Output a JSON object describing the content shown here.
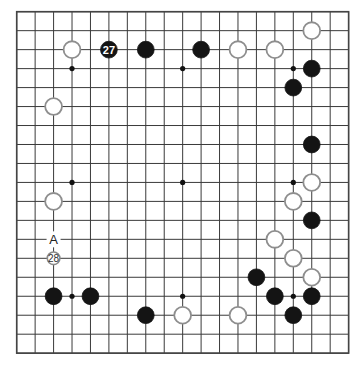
{
  "board": {
    "size": 19,
    "origin_x": 16.7,
    "origin_y": 11.7,
    "spacing_x": 18.44,
    "spacing_y": 18.97,
    "stone_radius": 8.4,
    "colors": {
      "grid": "#3a3a3a",
      "black_stone": "#141414",
      "white_stone_fill": "#ffffff",
      "white_stone_border": "#8e8e8e"
    }
  },
  "star_points": [
    [
      3,
      3
    ],
    [
      9,
      3
    ],
    [
      15,
      3
    ],
    [
      3,
      9
    ],
    [
      9,
      9
    ],
    [
      15,
      9
    ],
    [
      3,
      15
    ],
    [
      9,
      15
    ],
    [
      15,
      15
    ]
  ],
  "stones": [
    {
      "color": "white",
      "col": 16,
      "row": 1
    },
    {
      "color": "white",
      "col": 3,
      "row": 2
    },
    {
      "color": "black",
      "col": 5,
      "row": 2,
      "number": "27"
    },
    {
      "color": "black",
      "col": 7,
      "row": 2
    },
    {
      "color": "black",
      "col": 10,
      "row": 2
    },
    {
      "color": "white",
      "col": 12,
      "row": 2
    },
    {
      "color": "white",
      "col": 14,
      "row": 2
    },
    {
      "color": "black",
      "col": 16,
      "row": 3
    },
    {
      "color": "black",
      "col": 15,
      "row": 4
    },
    {
      "color": "white",
      "col": 2,
      "row": 5
    },
    {
      "color": "black",
      "col": 16,
      "row": 7
    },
    {
      "color": "white",
      "col": 16,
      "row": 9
    },
    {
      "color": "white",
      "col": 2,
      "row": 10
    },
    {
      "color": "white",
      "col": 15,
      "row": 10
    },
    {
      "color": "black",
      "col": 16,
      "row": 11
    },
    {
      "color": "white",
      "col": 14,
      "row": 12
    },
    {
      "color": "white",
      "col": 2,
      "row": 13,
      "number": "28",
      "small": true
    },
    {
      "color": "white",
      "col": 15,
      "row": 13
    },
    {
      "color": "black",
      "col": 13,
      "row": 14
    },
    {
      "color": "white",
      "col": 16,
      "row": 14
    },
    {
      "color": "black",
      "col": 2,
      "row": 15
    },
    {
      "color": "black",
      "col": 4,
      "row": 15
    },
    {
      "color": "black",
      "col": 14,
      "row": 15
    },
    {
      "color": "black",
      "col": 16,
      "row": 15
    },
    {
      "color": "black",
      "col": 7,
      "row": 16
    },
    {
      "color": "white",
      "col": 9,
      "row": 16
    },
    {
      "color": "white",
      "col": 12,
      "row": 16
    },
    {
      "color": "black",
      "col": 15,
      "row": 16
    }
  ],
  "labels": [
    {
      "text": "A",
      "col": 2,
      "row": 12
    }
  ]
}
